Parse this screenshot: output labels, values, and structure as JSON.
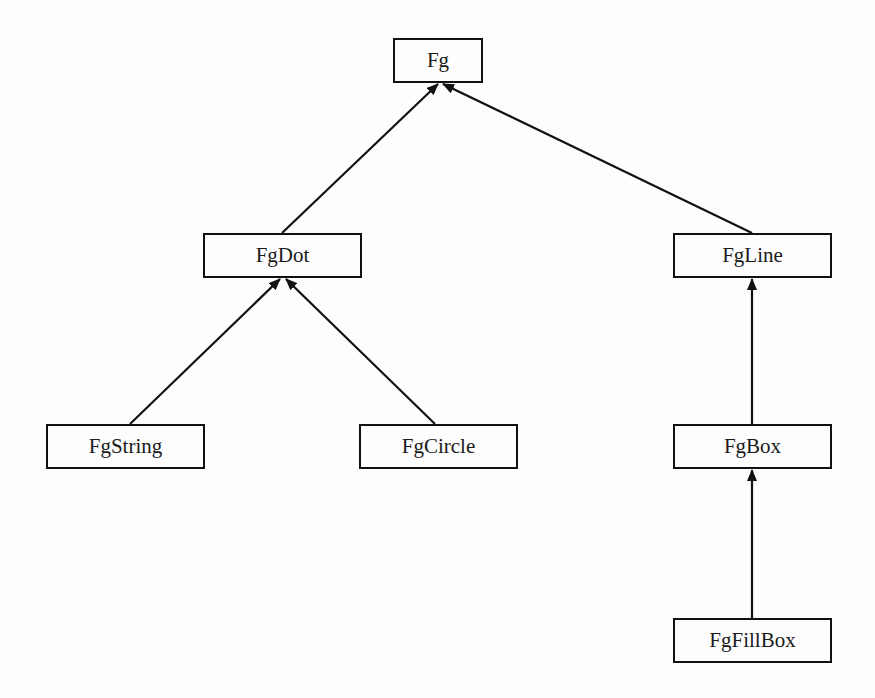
{
  "diagram": {
    "type": "class-hierarchy",
    "nodes": [
      {
        "id": "Fg",
        "label": "Fg",
        "x": 393,
        "y": 38,
        "w": 90,
        "h": 45
      },
      {
        "id": "FgDot",
        "label": "FgDot",
        "x": 203,
        "y": 233,
        "w": 159,
        "h": 45
      },
      {
        "id": "FgLine",
        "label": "FgLine",
        "x": 673,
        "y": 233,
        "w": 159,
        "h": 45
      },
      {
        "id": "FgString",
        "label": "FgString",
        "x": 46,
        "y": 424,
        "w": 159,
        "h": 45
      },
      {
        "id": "FgCircle",
        "label": "FgCircle",
        "x": 359,
        "y": 424,
        "w": 159,
        "h": 45
      },
      {
        "id": "FgBox",
        "label": "FgBox",
        "x": 673,
        "y": 424,
        "w": 159,
        "h": 45
      },
      {
        "id": "FgFillBox",
        "label": "FgFillBox",
        "x": 673,
        "y": 618,
        "w": 159,
        "h": 45
      }
    ],
    "edges": [
      {
        "from": "FgDot",
        "to": "Fg",
        "x1": 282,
        "y1": 233,
        "x2": 438,
        "y2": 84
      },
      {
        "from": "FgLine",
        "to": "Fg",
        "x1": 752,
        "y1": 233,
        "x2": 443,
        "y2": 84
      },
      {
        "from": "FgString",
        "to": "FgDot",
        "x1": 130,
        "y1": 424,
        "x2": 280,
        "y2": 279
      },
      {
        "from": "FgCircle",
        "to": "FgDot",
        "x1": 435,
        "y1": 424,
        "x2": 286,
        "y2": 279
      },
      {
        "from": "FgBox",
        "to": "FgLine",
        "x1": 752,
        "y1": 424,
        "x2": 752,
        "y2": 279
      },
      {
        "from": "FgFillBox",
        "to": "FgBox",
        "x1": 752,
        "y1": 618,
        "x2": 752,
        "y2": 470
      }
    ],
    "colors": {
      "line": "#111111",
      "background": "#fdfdfd",
      "text": "#1a1a1a"
    }
  }
}
